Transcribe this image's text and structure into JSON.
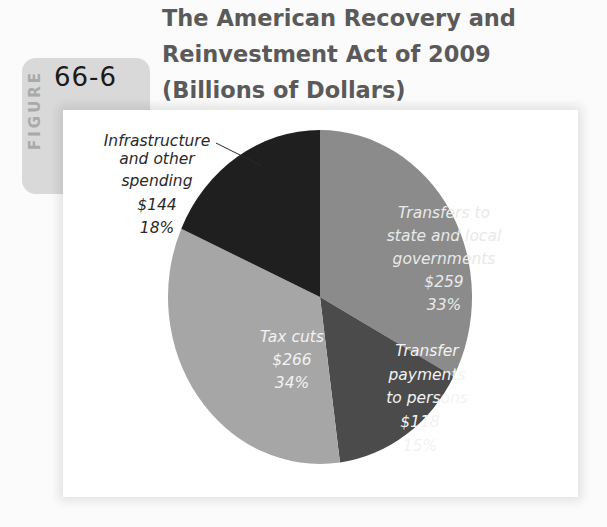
{
  "figure": {
    "tab_word": "FIGURE",
    "number": "66-6",
    "title_lines": [
      "The American Recovery and",
      "Reinvestment Act of 2009",
      "(Billions of Dollars)"
    ]
  },
  "colors": {
    "transfers_state_local": "#8b8b8b",
    "transfer_payments": "#4b4b4b",
    "tax_cuts": "#a6a6a6",
    "infrastructure": "#1f1f1f",
    "title": "#5a5a5a",
    "tab": "#d9d9d9"
  },
  "labels": {
    "infrastructure": [
      "Infrastructure",
      "and other",
      "spending",
      "$144",
      "18%"
    ],
    "transfers_state_local": [
      "Transfers to",
      "state and local",
      "governments",
      "$259",
      "33%"
    ],
    "tax_cuts": [
      "Tax cuts",
      "$266",
      "34%"
    ],
    "transfer_payments": [
      "Transfer",
      "payments",
      "to persons",
      "$118",
      "15%"
    ]
  },
  "chart_data": {
    "type": "pie",
    "title": "The American Recovery and Reinvestment Act of 2009 (Billions of Dollars)",
    "figure_label": "Figure 66-6",
    "unit": "Billions of Dollars",
    "categories": [
      "Transfers to state and local governments",
      "Transfer payments to persons",
      "Tax cuts",
      "Infrastructure and other spending"
    ],
    "values": [
      259,
      118,
      266,
      144
    ],
    "percentages": [
      33,
      15,
      34,
      18
    ],
    "start_angle": "12 o'clock",
    "direction": "clockwise",
    "legend": "none (direct labels)",
    "grid": false
  }
}
